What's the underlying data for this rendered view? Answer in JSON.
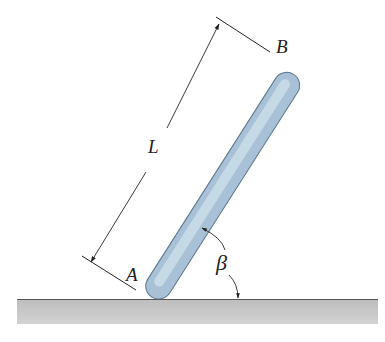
{
  "diagram": {
    "labels": {
      "point_top": "B",
      "point_bottom": "A",
      "length": "L",
      "angle": "β"
    },
    "colors": {
      "rod_fill_light": "#cfe0ec",
      "rod_fill_dark": "#7f9cb8",
      "rod_stroke": "#5a7590",
      "ground_fill": "#c8c8c8",
      "ground_line": "#555555",
      "line": "#222222"
    }
  }
}
